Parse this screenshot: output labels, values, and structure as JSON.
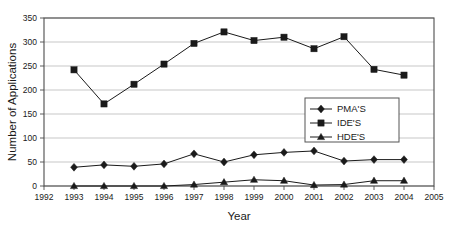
{
  "chart_data": {
    "type": "line",
    "title": "",
    "xlabel": "Year",
    "ylabel": "Number of Applications",
    "x": [
      1993,
      1994,
      1995,
      1996,
      1997,
      1998,
      1999,
      2000,
      2001,
      2002,
      2003,
      2004
    ],
    "xlim": [
      1992,
      2005
    ],
    "ylim": [
      0,
      350
    ],
    "xticks": [
      1992,
      1993,
      1994,
      1995,
      1996,
      1997,
      1998,
      1999,
      2000,
      2001,
      2002,
      2003,
      2004,
      2005
    ],
    "yticks": [
      0,
      50,
      100,
      150,
      200,
      250,
      300,
      350
    ],
    "grid": "horizontal",
    "legend_position": "center-right",
    "series": [
      {
        "name": "PMA'S",
        "marker": "diamond",
        "values": [
          39,
          44,
          41,
          46,
          67,
          50,
          65,
          70,
          73,
          52,
          55,
          55
        ]
      },
      {
        "name": "IDE'S",
        "marker": "square",
        "values": [
          242,
          171,
          212,
          254,
          297,
          321,
          303,
          310,
          286,
          311,
          243,
          231
        ]
      },
      {
        "name": "HDE'S",
        "marker": "triangle",
        "values": [
          0,
          0,
          0,
          0,
          3,
          8,
          13,
          11,
          2,
          3,
          11,
          11
        ]
      }
    ]
  },
  "axis": {
    "ylabel": "Number of Applications",
    "xlabel": "Year"
  },
  "legend": {
    "entries": [
      {
        "label": "PMA'S",
        "marker": "diamond"
      },
      {
        "label": "IDE'S",
        "marker": "square"
      },
      {
        "label": "HDE'S",
        "marker": "triangle"
      }
    ]
  },
  "colors": {
    "ink": "#1a1a1a",
    "grid": "#b9b9b9",
    "axis": "#4d4d4d",
    "background": "#ffffff"
  }
}
